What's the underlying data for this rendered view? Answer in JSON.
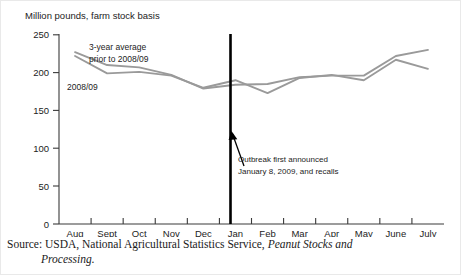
{
  "chart_data": {
    "type": "line",
    "title": "Million pounds, farm stock basis",
    "xlabel": "",
    "ylabel": "Million pounds, farm stock basis",
    "ylim": [
      0,
      250
    ],
    "yticks": [
      0,
      50,
      100,
      150,
      200,
      250
    ],
    "grid": false,
    "legend_position": "inline-annotation",
    "categories": [
      "Aug",
      "Sept",
      "Oct",
      "Nov",
      "Dec",
      "Jan",
      "Feb",
      "Mar",
      "Apr",
      "May",
      "June",
      "July"
    ],
    "series": [
      {
        "name": "3-year average prior to 2008/09",
        "color": "#9a9a9a",
        "values": [
          227,
          210,
          207,
          197,
          179,
          184,
          185,
          194,
          196,
          196,
          222,
          230
        ]
      },
      {
        "name": "2008/09",
        "color": "#9a9a9a",
        "values": [
          222,
          199,
          201,
          196,
          180,
          190,
          173,
          193,
          197,
          190,
          217,
          205
        ]
      }
    ],
    "annotations": [
      {
        "name": "outbreak-marker",
        "text_line1": "Outbreak first announced",
        "text_line2": "January 8, 2009, and recalls",
        "at_category": "Jan",
        "type": "vertical-line-with-arrow"
      }
    ],
    "series_inline_labels": [
      {
        "name": "avg-label-line1",
        "text": "3-year average"
      },
      {
        "name": "avg-label-line2",
        "text": "prior to 2008/09"
      },
      {
        "name": "current-label",
        "text": "2008/09"
      }
    ]
  },
  "axis": {
    "y_tick_labels": [
      "250",
      "200",
      "150",
      "100",
      "50",
      "0"
    ],
    "x_tick_labels": [
      "Aug",
      "Sept",
      "Oct",
      "Nov",
      "Dec",
      "Jan",
      "Feb",
      "Mar",
      "Apr",
      "May",
      "June",
      "July"
    ]
  },
  "source": {
    "lead": "Source:  USDA,  National  Agricultural  Statistics  Service,  ",
    "italic": "Peanut  Stocks  and",
    "line2_italic": "Processing."
  },
  "colors": {
    "series_line": "#9a9a9a",
    "axis": "#3a3a3a",
    "marker_line": "#000000",
    "text": "#1c1c1c"
  }
}
